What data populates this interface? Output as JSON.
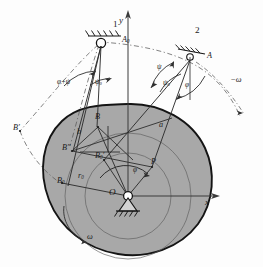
{
  "figure": {
    "type": "technical-line-diagram",
    "width": 263,
    "height": 267,
    "colors": {
      "cam_fill": "#a8a8a8",
      "cam_outline": "#141414",
      "line": "#3a3a3a",
      "dashed": "#5a5a5a",
      "text": "#1b1b1b",
      "background": "#fdfdfd"
    }
  },
  "axes": {
    "y_label": "y",
    "x_label": "x",
    "origin_label": "O"
  },
  "positions": {
    "pivot_A0_label": "A",
    "pivot_A0_sub": "0",
    "pivot_A_label": "A",
    "link_1_label": "1",
    "link_2_label": "2"
  },
  "angles": {
    "phi_plus_psi": "φ+ψ",
    "psi_zero_left": "ψ",
    "psi_zero_left_sub": "0",
    "psi": "ψ",
    "psi_zero_right": "ψ",
    "psi_zero_right_sub": "0",
    "phi_right": "φ",
    "phi_center": "φ"
  },
  "points": {
    "B": "B",
    "B_prime": "B′",
    "B_double_prime": "B″",
    "B_zero": "B",
    "B_zero_sub": "0",
    "B_zero_prime": "B",
    "B_zero_prime_sub": "0",
    "B_zero_prime_mark": "′",
    "P": "P"
  },
  "lengths": {
    "a": "a",
    "b": "b",
    "r_zero": "r",
    "r_zero_sub": "0"
  },
  "rotation": {
    "omega_cam": "ω",
    "omega_follower": "ω",
    "omega_follower_prefix": "−"
  }
}
